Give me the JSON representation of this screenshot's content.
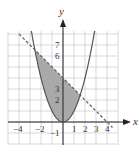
{
  "chart_data": {
    "type": "area",
    "title": "",
    "xlabel": "x",
    "ylabel": "y",
    "xlim": [
      -5,
      5
    ],
    "ylim": [
      -2,
      8.3
    ],
    "grid": true,
    "legend": null,
    "x_tick_labels": [
      "-4",
      "-2",
      "1",
      "2",
      "3",
      "4"
    ],
    "x_ticks": [
      -4,
      -2,
      1,
      2,
      3,
      4
    ],
    "y_tick_labels": [
      "-1",
      "2",
      "3",
      "6",
      "7"
    ],
    "y_ticks": [
      -1,
      2,
      3,
      6,
      7
    ],
    "series": [
      {
        "name": "y = x^2",
        "style": "solid",
        "color": "#555555",
        "x": [
          -2.9,
          -2.5,
          -2,
          -1.5,
          -1,
          -0.5,
          0,
          0.5,
          1,
          1.5,
          2,
          2.5,
          2.9
        ],
        "y": [
          8.41,
          6.25,
          4,
          2.25,
          1,
          0.25,
          0,
          0.25,
          1,
          2.25,
          4,
          6.25,
          8.41
        ]
      },
      {
        "name": "y = 4 - x",
        "style": "dashed",
        "color": "#555555",
        "x": [
          -4,
          4.5
        ],
        "y": [
          8,
          -0.5
        ]
      }
    ],
    "shaded_region": {
      "description": "region between y = x^2 (below) and y = 4 - x (above)",
      "x_from": -2.56,
      "x_to": 1.56,
      "color": "#a9a9a9"
    },
    "intersections": [
      [
        -2.56,
        6.56
      ],
      [
        1.56,
        2.44
      ]
    ]
  }
}
